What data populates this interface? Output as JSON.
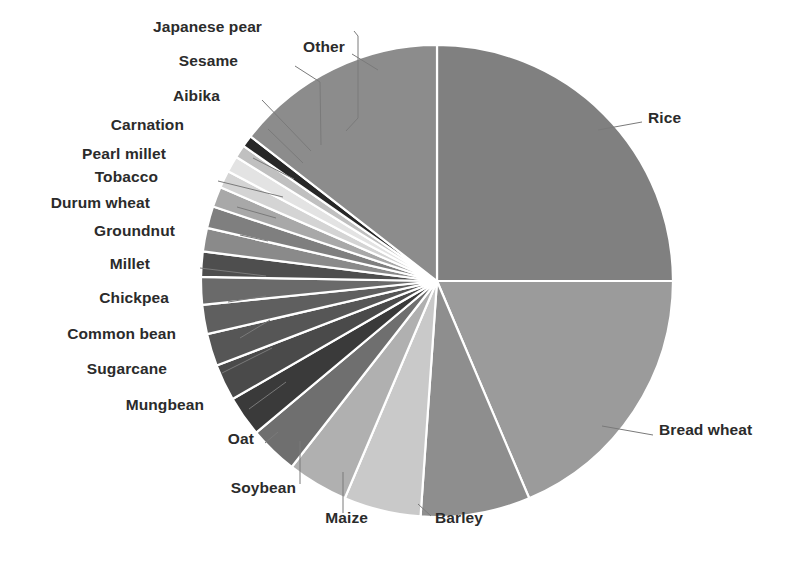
{
  "figure": {
    "kind": "pie-chart",
    "background": "#ffffff",
    "label_color": "#2b2b2b",
    "leader_color": "#7a7a7a",
    "slice_gap_color": "#ffffff"
  },
  "chart_data": {
    "type": "pie",
    "title": "",
    "xlabel": "",
    "ylabel": "",
    "legend_position": "none",
    "grid": false,
    "start_angle_deg": 0,
    "direction": "clockwise",
    "center": {
      "x": 437,
      "y": 281
    },
    "radius": 236,
    "categories": [
      "Rice",
      "Bread wheat",
      "Barley",
      "Maize",
      "Soybean",
      "Oat",
      "Mungbean",
      "Sugarcane",
      "Common bean",
      "Chickpea",
      "Millet",
      "Groundnut",
      "Durum wheat",
      "Tobacco",
      "Pearl millet",
      "Carnation",
      "Aibika",
      "Sesame",
      "Japanese pear",
      "Other"
    ],
    "values": [
      25.0,
      18.6,
      7.5,
      5.3,
      4.2,
      3.3,
      2.8,
      2.5,
      2.2,
      2.0,
      1.9,
      1.7,
      1.6,
      1.5,
      1.4,
      1.2,
      1.1,
      0.9,
      0.8,
      14.5
    ],
    "unit": "percent",
    "slice_angles_deg": [
      90.0,
      67.0,
      27.0,
      19.0,
      15.0,
      12.0,
      10.0,
      9.0,
      8.0,
      7.2,
      6.8,
      6.2,
      5.8,
      5.4,
      5.0,
      4.3,
      4.0,
      3.2,
      2.9,
      52.2
    ],
    "slice_colors": [
      "#808080",
      "#9b9b9b",
      "#8e8e8e",
      "#c9c9c9",
      "#b0b0b0",
      "#6f6f6f",
      "#3a3a3a",
      "#4a4a4a",
      "#565656",
      "#5f5f5f",
      "#6a6a6a",
      "#4e4e4e",
      "#8a8a8a",
      "#7f7f7f",
      "#a8a8a8",
      "#d4d4d4",
      "#e3e3e3",
      "#c0c0c0",
      "#272727",
      "#8c8c8c"
    ]
  },
  "labels": [
    {
      "name": "label-japanese-pear",
      "text": "Japanese pear",
      "align": "right",
      "x": 262,
      "y": 27
    },
    {
      "name": "label-other",
      "text": "Other",
      "align": "left",
      "x": 303,
      "y": 47
    },
    {
      "name": "label-sesame",
      "text": "Sesame",
      "align": "right",
      "x": 238,
      "y": 61
    },
    {
      "name": "label-aibika",
      "text": "Aibika",
      "align": "right",
      "x": 220,
      "y": 96
    },
    {
      "name": "label-carnation",
      "text": "Carnation",
      "align": "right",
      "x": 184,
      "y": 125
    },
    {
      "name": "label-pearl-millet",
      "text": "Pearl millet",
      "align": "right",
      "x": 166,
      "y": 154
    },
    {
      "name": "label-tobacco",
      "text": "Tobacco",
      "action": "",
      "align": "right",
      "x": 158,
      "y": 177
    },
    {
      "name": "label-durum-wheat",
      "text": "Durum wheat",
      "align": "right",
      "x": 150,
      "y": 203
    },
    {
      "name": "label-groundnut",
      "text": "Groundnut",
      "align": "right",
      "x": 175,
      "y": 231
    },
    {
      "name": "label-millet",
      "text": "Millet",
      "align": "right",
      "x": 150,
      "y": 264
    },
    {
      "name": "label-chickpea",
      "text": "Chickpea",
      "align": "right",
      "x": 169,
      "y": 298
    },
    {
      "name": "label-common-bean",
      "text": "Common bean",
      "align": "right",
      "x": 176,
      "y": 334
    },
    {
      "name": "label-sugarcane",
      "text": "Sugarcane",
      "align": "right",
      "x": 167,
      "y": 369
    },
    {
      "name": "label-mungbean",
      "text": "Mungbean",
      "align": "right",
      "x": 204,
      "y": 405
    },
    {
      "name": "label-oat",
      "text": "Oat",
      "align": "right",
      "x": 254,
      "y": 439
    },
    {
      "name": "label-soybean",
      "text": "Soybean",
      "align": "right",
      "x": 296,
      "y": 488
    },
    {
      "name": "label-maize",
      "text": "Maize",
      "align": "right",
      "x": 368,
      "y": 518
    },
    {
      "name": "label-barley",
      "text": "Barley",
      "align": "left",
      "x": 435,
      "y": 518
    },
    {
      "name": "label-bread-wheat",
      "text": "Bread wheat",
      "align": "left",
      "x": 659,
      "y": 430
    },
    {
      "name": "label-rice",
      "text": "Rice",
      "align": "left",
      "x": 648,
      "y": 118
    }
  ],
  "leaders": [
    {
      "name": "leader-japanese-pear",
      "points": "354,31 358,36 358,118 346,131"
    },
    {
      "name": "leader-other",
      "points": "352,54 378,70"
    },
    {
      "name": "leader-sesame",
      "points": "295,66 320,82 321,145"
    },
    {
      "name": "leader-aibika",
      "points": "262,100 311,151"
    },
    {
      "name": "leader-carnation",
      "points": "268,129 303,163"
    },
    {
      "name": "leader-pearl-millet",
      "points": "253,158 294,179"
    },
    {
      "name": "leader-tobacco",
      "points": "218,181 283,197"
    },
    {
      "name": "leader-durum-wheat",
      "points": "237,207 276,218"
    },
    {
      "name": "leader-groundnut",
      "points": "240,235 268,241"
    },
    {
      "name": "leader-millet",
      "points": "200,268 266,276"
    },
    {
      "name": "leader-chickpea",
      "points": "228,302 266,296"
    },
    {
      "name": "leader-common-bean",
      "points": "240,338 270,320"
    },
    {
      "name": "leader-sugarcane",
      "points": "222,373 272,348"
    },
    {
      "name": "leader-mungbean",
      "points": "249,409 286,382"
    },
    {
      "name": "leader-oat",
      "points": "265,443 278,432"
    },
    {
      "name": "leader-soybean",
      "points": "300,484 300,441"
    },
    {
      "name": "leader-maize",
      "points": "343,513 343,472"
    },
    {
      "name": "leader-barley",
      "points": "431,516 418,504"
    },
    {
      "name": "leader-bread-wheat",
      "points": "653,435 602,426"
    },
    {
      "name": "leader-rice",
      "points": "642,122 598,130"
    }
  ]
}
